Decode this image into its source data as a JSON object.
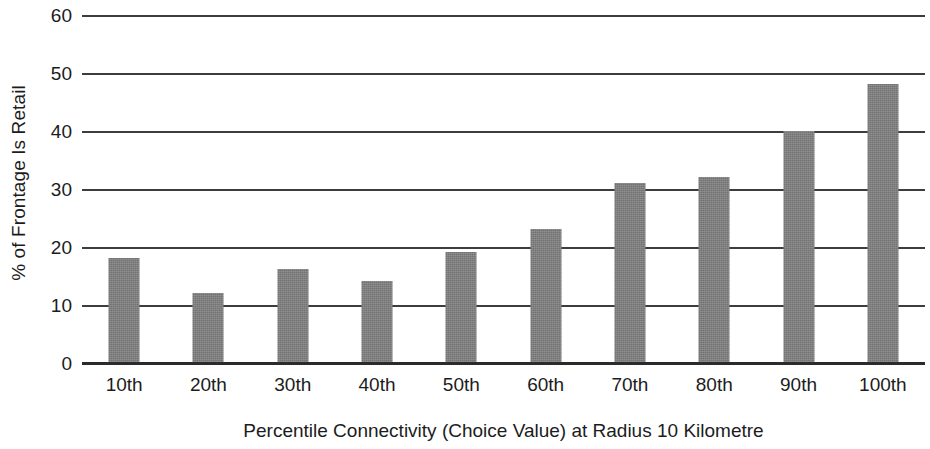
{
  "chart_data": {
    "type": "bar",
    "title": "",
    "xlabel": "Percentile Connectivity (Choice Value) at Radius 10 Kilometre",
    "ylabel": "% of Frontage Is Retail",
    "categories": [
      "10th",
      "20th",
      "30th",
      "40th",
      "50th",
      "60th",
      "70th",
      "80th",
      "90th",
      "100th"
    ],
    "values": [
      18,
      12,
      16,
      14,
      19,
      23,
      31,
      32,
      40,
      48
    ],
    "ylim": [
      0,
      60
    ],
    "yticks": [
      0,
      10,
      20,
      30,
      40,
      50,
      60
    ],
    "ytick_labels": [
      "0",
      "10",
      "20",
      "30",
      "40",
      "50",
      "60"
    ],
    "grid": "horizontal",
    "legend": "none",
    "bar_color": "#7e7e7e",
    "axis_color": "#3d3d3d"
  }
}
